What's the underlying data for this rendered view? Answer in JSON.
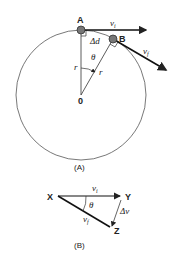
{
  "figure_a": {
    "caption": "(A)",
    "point_a": "A",
    "point_b": "B",
    "center": "0",
    "radius_label": "r",
    "radius_label_2": "r",
    "angle": "θ",
    "arc_length": "Δd",
    "initial_velocity": "v",
    "initial_velocity_sub": "i",
    "final_velocity": "v",
    "final_velocity_sub": "f"
  },
  "figure_b": {
    "caption": "(B)",
    "vertex_x": "X",
    "vertex_y": "Y",
    "vertex_z": "Z",
    "angle": "θ",
    "initial_velocity": "v",
    "initial_velocity_sub": "i",
    "final_velocity": "v",
    "final_velocity_sub": "f",
    "delta_v": "Δv"
  },
  "colors": {
    "stroke": "#222222",
    "circle": "#444444",
    "background": "#ffffff"
  }
}
